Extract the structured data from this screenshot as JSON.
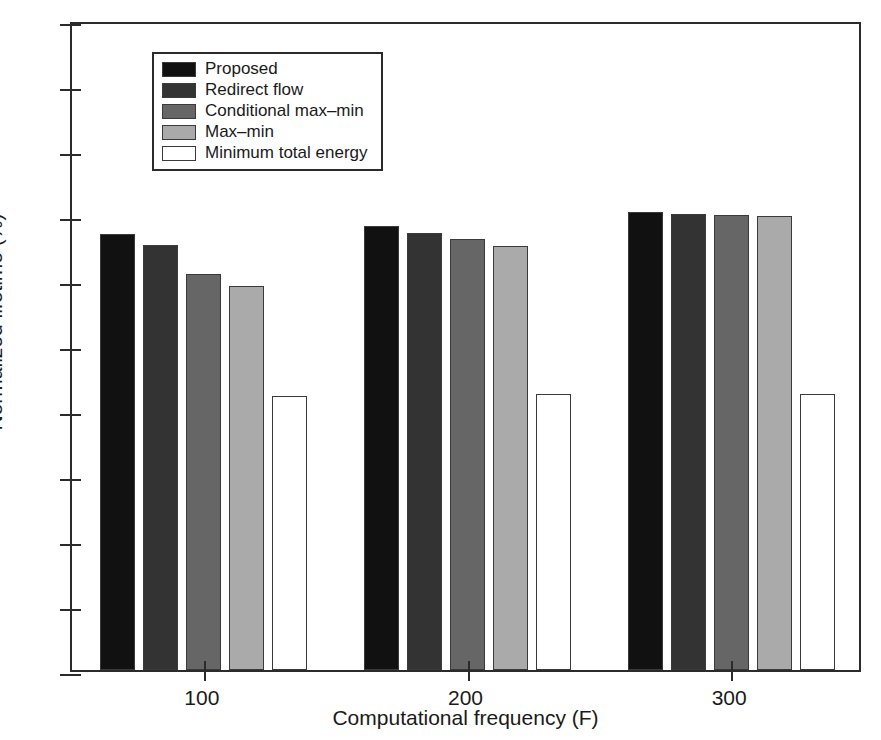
{
  "chart_data": {
    "type": "bar",
    "title": "",
    "xlabel": "Computational frequency (F)",
    "ylabel": "Normalized lifetime (%)",
    "categories": [
      "100",
      "200",
      "300"
    ],
    "ylim": [
      0,
      100
    ],
    "xlim_note": "grouped categorical",
    "yticks": [
      "0",
      "10",
      "20",
      "30",
      "40",
      "50",
      "60",
      "70",
      "80",
      "90",
      "100"
    ],
    "ytick_step": 10,
    "grid": false,
    "legend_position": "upper left inside axes",
    "series": [
      {
        "name": "Proposed",
        "color": "#111111",
        "values": [
          67.1,
          68.3,
          70.4
        ]
      },
      {
        "name": "Redirect flow",
        "color": "#333333",
        "values": [
          65.4,
          67.2,
          70.2
        ]
      },
      {
        "name": "Conditional max–min",
        "color": "#666666",
        "values": [
          60.9,
          66.3,
          70.0
        ]
      },
      {
        "name": "Max–min",
        "color": "#aaaaaa",
        "values": [
          59.1,
          65.3,
          69.9
        ]
      },
      {
        "name": "Minimum total energy",
        "color": "#ffffff",
        "values": [
          42.2,
          42.4,
          42.5
        ]
      }
    ]
  },
  "axes": {
    "frame_color": "#2b2b2b",
    "background": "#ffffff"
  }
}
